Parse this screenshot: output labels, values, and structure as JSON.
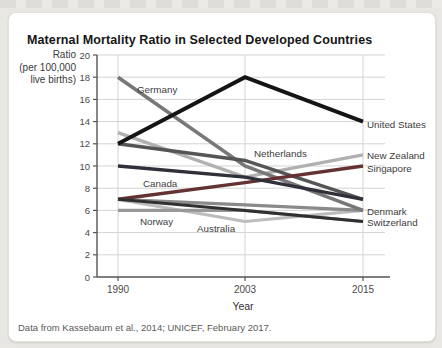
{
  "footer": {
    "text": "Data from Kassebaum et al., 2014; UNICEF, February 2017."
  },
  "chart_data": {
    "type": "line",
    "title": "Maternal Mortality Ratio in Selected Developed Countries",
    "ylabel": {
      "line1": "Ratio",
      "line2": "(per 100,000",
      "line3": "live births)"
    },
    "xlabel": "Year",
    "x_categories": [
      "1990",
      "2003",
      "2015"
    ],
    "ylim": [
      0,
      20
    ],
    "ytick_step": 2,
    "grid": true,
    "legend_position": "none",
    "axis_color": "#555555",
    "grid_color": "#d3d3d3",
    "series": [
      {
        "name": "Australia",
        "values": [
          7,
          5,
          6
        ],
        "color": "#bdbdbd",
        "width": 3.2,
        "label": {
          "x": 197,
          "y": 229
        }
      },
      {
        "name": "New Zealand",
        "values": [
          13,
          9,
          11
        ],
        "color": "#b0b0b0",
        "width": 3.4,
        "label": {
          "x": 367,
          "y": 156
        }
      },
      {
        "name": "Norway",
        "values": [
          6,
          6,
          5
        ],
        "color": "#989898",
        "width": 3.2,
        "label": {
          "x": 140,
          "y": 222
        }
      },
      {
        "name": "Denmark",
        "values": [
          7,
          6.5,
          6
        ],
        "color": "#8a8a8a",
        "width": 3.2,
        "label": {
          "x": 367,
          "y": 212
        }
      },
      {
        "name": "Germany",
        "values": [
          18,
          10,
          6
        ],
        "color": "#787878",
        "width": 3.6,
        "label": {
          "x": 137,
          "y": 90
        }
      },
      {
        "name": "Netherlands",
        "values": [
          12,
          10.5,
          7
        ],
        "color": "#555555",
        "width": 3.4,
        "label": {
          "x": 254,
          "y": 154
        }
      },
      {
        "name": "Singapore",
        "values": [
          7,
          8.5,
          10
        ],
        "color": "#643233",
        "width": 3.4,
        "label": {
          "x": 367,
          "y": 169
        }
      },
      {
        "name": "Canada",
        "values": [
          10,
          9,
          7
        ],
        "color": "#30303a",
        "width": 3.4,
        "label": {
          "x": 143,
          "y": 184
        }
      },
      {
        "name": "Switzerland",
        "values": [
          7,
          6,
          5
        ],
        "color": "#303030",
        "width": 3.0,
        "label": {
          "x": 367,
          "y": 223
        }
      },
      {
        "name": "United States",
        "values": [
          12,
          18,
          14
        ],
        "color": "#151515",
        "width": 3.8,
        "label": {
          "x": 367,
          "y": 125
        }
      }
    ]
  }
}
